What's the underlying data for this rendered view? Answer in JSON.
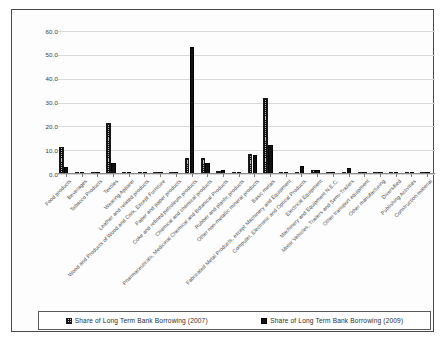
{
  "chart_data": {
    "type": "bar",
    "title": "",
    "xlabel": "",
    "ylabel": "",
    "ylim": [
      0.0,
      60.0
    ],
    "yticks": [
      "0.0",
      "10.0",
      "20.0",
      "30.0",
      "40.0",
      "50.0",
      "60.0"
    ],
    "grid": true,
    "legend_position": "bottom",
    "categories": [
      "Food products",
      "Beverages",
      "Tobacco Products",
      "Textiles",
      "Wearing Apparel",
      "Leather and related products",
      "Wood and Products of Wood and Cork, Except Furniture",
      "Paper and paper products",
      "Coke and refined petroleum products",
      "Chemical and chemical products",
      "Pharmaceuticals, Medicinal Chemical and Botanical Products",
      "Rubber and plastic products",
      "Other non-metallic mineral products",
      "Basic metals",
      "Fabricated Metal Products, except Machinery and Equipment",
      "Computer, Electronic and Optical Products",
      "Electrical Equipment",
      "Machinery and Equipment N.E.C.",
      "Motor Vehicles, Trailers and Semi-Trailers",
      "Other transport equipment",
      "Other manufacturing",
      "Diversified",
      "Publishing Activities",
      "Construction material"
    ],
    "series": [
      {
        "name": "Share of Long Term Bank Borrowing (2007)",
        "color": "#c9c9c9",
        "pattern": "dotted-hatch",
        "values": [
          11.2,
          0.9,
          0.1,
          21.3,
          0.2,
          0.1,
          0.1,
          1.0,
          6.6,
          6.9,
          1.3,
          0.7,
          8.2,
          31.9,
          0.2,
          0.3,
          1.7,
          0.1,
          0.6,
          0.2,
          0.1,
          0.5,
          0.1,
          0.1
        ]
      },
      {
        "name": "Share of Long Term Bank Borrowing (2009)",
        "color": "#111111",
        "pattern": "solid",
        "values": [
          2.9,
          0.4,
          0.1,
          4.8,
          0.3,
          0.1,
          0.1,
          0.5,
          53.4,
          4.5,
          1.6,
          0.8,
          8.0,
          12.3,
          0.1,
          3.4,
          1.5,
          0.2,
          2.6,
          0.2,
          0.1,
          0.6,
          0.1,
          0.1
        ]
      }
    ]
  },
  "legend": {
    "items": [
      {
        "label": "Share of Long Term Bank Borrowing (2007)",
        "swatch": "hatched-swatch"
      },
      {
        "label": "Share of Long Term Bank Borrowing (2009)",
        "swatch": "solid-swatch"
      }
    ]
  }
}
